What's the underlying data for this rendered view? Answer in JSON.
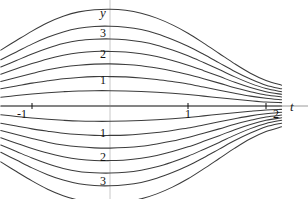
{
  "figure": {
    "title": "",
    "background_color": "#ffffff",
    "curve_color": "#3c3c3c",
    "axis_color": "#9a9a9a",
    "text_color": "#111111"
  },
  "axes": {
    "y_axis": {
      "label": "y",
      "position_px": 110,
      "tick_labels": [
        "3",
        "2",
        "1",
        "1",
        "2",
        "3"
      ],
      "tick_values": [
        3,
        2,
        1,
        -1,
        -2,
        -3
      ],
      "tick_y_px": [
        33,
        54,
        80,
        133,
        157,
        181
      ]
    },
    "t_axis": {
      "label": "t",
      "position_px": 106,
      "tick_labels": [
        "-1",
        "1",
        "2"
      ],
      "tick_values": [
        -1,
        1,
        2
      ],
      "tick_x_px": [
        22,
        188,
        276
      ]
    }
  },
  "chart_data": {
    "type": "line",
    "title": "",
    "xlabel": "t",
    "ylabel": "y",
    "xlim": [
      -1.4,
      2.25
    ],
    "ylim": [
      -4.6,
      4.6
    ],
    "grid": false,
    "legend": null,
    "annotations": [],
    "x": [
      -1.4,
      -1.2,
      -1.0,
      -0.8,
      -0.6,
      -0.4,
      -0.2,
      0.0,
      0.2,
      0.4,
      0.6,
      0.8,
      1.0,
      1.2,
      1.4,
      1.6,
      1.8,
      2.0,
      2.2
    ],
    "series": [
      {
        "name": "c = 4",
        "values": [
          2.15,
          2.52,
          2.88,
          3.2,
          3.45,
          3.62,
          3.7,
          3.72,
          3.68,
          3.57,
          3.38,
          3.12,
          2.8,
          2.42,
          2.02,
          1.62,
          1.26,
          0.98,
          0.8
        ]
      },
      {
        "name": "c = 3",
        "values": [
          1.78,
          2.08,
          2.38,
          2.64,
          2.85,
          2.99,
          3.06,
          3.07,
          3.03,
          2.94,
          2.78,
          2.56,
          2.3,
          1.99,
          1.66,
          1.33,
          1.04,
          0.8,
          0.66
        ]
      },
      {
        "name": "c = 2.5",
        "values": [
          1.5,
          1.75,
          2.0,
          2.22,
          2.4,
          2.52,
          2.57,
          2.58,
          2.55,
          2.47,
          2.34,
          2.15,
          1.93,
          1.67,
          1.4,
          1.12,
          0.87,
          0.67,
          0.55
        ]
      },
      {
        "name": "c = 2",
        "values": [
          1.22,
          1.43,
          1.63,
          1.81,
          1.95,
          2.05,
          2.1,
          2.1,
          2.08,
          2.01,
          1.9,
          1.75,
          1.57,
          1.36,
          1.14,
          0.91,
          0.71,
          0.55,
          0.45
        ]
      },
      {
        "name": "c = 1.5",
        "values": [
          0.94,
          1.1,
          1.25,
          1.39,
          1.5,
          1.57,
          1.61,
          1.62,
          1.6,
          1.55,
          1.46,
          1.35,
          1.21,
          1.05,
          0.88,
          0.7,
          0.55,
          0.42,
          0.35
        ]
      },
      {
        "name": "c = 1",
        "values": [
          0.66,
          0.77,
          0.88,
          0.97,
          1.05,
          1.1,
          1.13,
          1.13,
          1.12,
          1.08,
          1.02,
          0.94,
          0.85,
          0.73,
          0.61,
          0.49,
          0.38,
          0.3,
          0.24
        ]
      },
      {
        "name": "c = 0.5",
        "values": [
          0.34,
          0.4,
          0.46,
          0.51,
          0.55,
          0.58,
          0.59,
          0.59,
          0.58,
          0.56,
          0.53,
          0.49,
          0.44,
          0.38,
          0.32,
          0.26,
          0.2,
          0.15,
          0.13
        ]
      },
      {
        "name": "c = 0",
        "values": [
          0.0,
          0.0,
          0.0,
          0.0,
          0.0,
          0.0,
          0.0,
          0.0,
          0.0,
          0.0,
          0.0,
          0.0,
          0.0,
          0.0,
          0.0,
          0.0,
          0.0,
          0.0,
          0.0
        ]
      },
      {
        "name": "c = -0.5",
        "values": [
          -0.34,
          -0.4,
          -0.46,
          -0.51,
          -0.55,
          -0.58,
          -0.59,
          -0.59,
          -0.58,
          -0.56,
          -0.53,
          -0.49,
          -0.44,
          -0.38,
          -0.32,
          -0.26,
          -0.2,
          -0.15,
          -0.13
        ]
      },
      {
        "name": "c = -1",
        "values": [
          -0.66,
          -0.77,
          -0.88,
          -0.97,
          -1.05,
          -1.1,
          -1.13,
          -1.13,
          -1.12,
          -1.08,
          -1.02,
          -0.94,
          -0.85,
          -0.73,
          -0.61,
          -0.49,
          -0.38,
          -0.3,
          -0.24
        ]
      },
      {
        "name": "c = -1.5",
        "values": [
          -0.94,
          -1.1,
          -1.25,
          -1.39,
          -1.5,
          -1.57,
          -1.61,
          -1.62,
          -1.6,
          -1.55,
          -1.46,
          -1.35,
          -1.21,
          -1.05,
          -0.88,
          -0.7,
          -0.55,
          -0.42,
          -0.35
        ]
      },
      {
        "name": "c = -2",
        "values": [
          -1.22,
          -1.43,
          -1.63,
          -1.81,
          -1.95,
          -2.05,
          -2.1,
          -2.1,
          -2.08,
          -2.01,
          -1.9,
          -1.75,
          -1.57,
          -1.36,
          -1.14,
          -0.91,
          -0.71,
          -0.55,
          -0.45
        ]
      },
      {
        "name": "c = -2.5",
        "values": [
          -1.5,
          -1.75,
          -2.0,
          -2.22,
          -2.4,
          -2.52,
          -2.57,
          -2.58,
          -2.55,
          -2.47,
          -2.34,
          -2.15,
          -1.93,
          -1.67,
          -1.4,
          -1.12,
          -0.87,
          -0.67,
          -0.55
        ]
      },
      {
        "name": "c = -3",
        "values": [
          -1.78,
          -2.08,
          -2.38,
          -2.64,
          -2.85,
          -2.99,
          -3.06,
          -3.07,
          -3.03,
          -2.94,
          -2.78,
          -2.56,
          -2.3,
          -1.99,
          -1.66,
          -1.33,
          -1.04,
          -0.8,
          -0.66
        ]
      },
      {
        "name": "c = -4",
        "values": [
          -2.15,
          -2.52,
          -2.88,
          -3.2,
          -3.45,
          -3.62,
          -3.7,
          -3.72,
          -3.68,
          -3.57,
          -3.38,
          -3.12,
          -2.8,
          -2.42,
          -2.02,
          -1.62,
          -1.26,
          -0.98,
          -0.8
        ]
      }
    ]
  }
}
